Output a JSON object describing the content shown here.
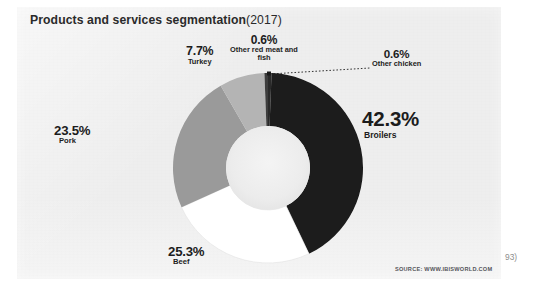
{
  "panel": {
    "background_color": "#eeeeee"
  },
  "header": {
    "title_main": "Products and services segmentation",
    "title_year": "(2017)",
    "title_full": "Products and services segmentation (2017)"
  },
  "footer": {
    "source": "SOURCE: WWW.IBISWORLD.COM",
    "page_marker": "93)"
  },
  "labels": {
    "broilers": {
      "pct": "42.3%",
      "name": "Broilers"
    },
    "beef": {
      "pct": "25.3%",
      "name": "Beef"
    },
    "pork": {
      "pct": "23.5%",
      "name": "Pork"
    },
    "turkey": {
      "pct": "7.7%",
      "name": "Turkey"
    },
    "other_red": {
      "pct": "0.6%",
      "name": "Other red meat and fish"
    },
    "other_chicken": {
      "pct": "0.6%",
      "name": "Other chicken"
    }
  },
  "chart_data": {
    "type": "pie",
    "variant": "donut",
    "subtitle": "",
    "xlabel": "",
    "ylabel": "",
    "units": "percent",
    "total": 100.0,
    "start_angle_deg": 0,
    "direction": "clockwise",
    "inner_radius_ratio": 0.44,
    "legend": "none",
    "grid": false,
    "labels_inline": true,
    "categories": [
      "Other chicken",
      "Broilers",
      "Beef",
      "Pork",
      "Turkey",
      "Other red meat and fish"
    ],
    "values": [
      0.6,
      42.3,
      25.3,
      23.5,
      7.7,
      0.6
    ],
    "colors": [
      "#2b2b2b",
      "#1a1a1a",
      "#ffffff",
      "#9a9a9a",
      "#b4b4b4",
      "#3c3c3c"
    ],
    "slices": [
      {
        "label": "Other chicken",
        "value": 0.6,
        "color": "#2b2b2b",
        "leader_line": true
      },
      {
        "label": "Broilers",
        "value": 42.3,
        "color": "#1a1a1a",
        "leader_line": false
      },
      {
        "label": "Beef",
        "value": 25.3,
        "color": "#ffffff",
        "leader_line": false
      },
      {
        "label": "Pork",
        "value": 23.5,
        "color": "#9a9a9a",
        "leader_line": false
      },
      {
        "label": "Turkey",
        "value": 7.7,
        "color": "#b4b4b4",
        "leader_line": false
      },
      {
        "label": "Other red meat and fish",
        "value": 0.6,
        "color": "#3c3c3c",
        "leader_line": false
      }
    ],
    "source": "SOURCE: WWW.IBISWORLD.COM"
  }
}
